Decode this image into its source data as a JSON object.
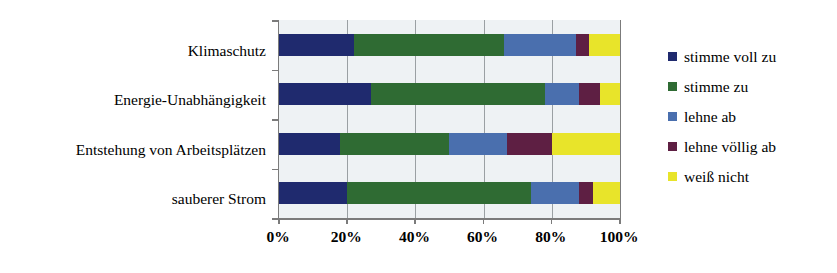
{
  "chart_data": {
    "type": "bar",
    "orientation": "horizontal",
    "stacked": true,
    "stack_mode": "percent",
    "title": "",
    "xlabel": "",
    "ylabel": "",
    "xlim": [
      0,
      100
    ],
    "grid": true,
    "legend_position": "right",
    "categories": [
      "Klimaschutz",
      "Energie-Unabhängigkeit",
      "Entstehung von Arbeitsplätzen",
      "sauberer Strom"
    ],
    "xticks": [
      "0%",
      "20%",
      "40%",
      "60%",
      "80%",
      "100%"
    ],
    "xtick_values": [
      0,
      20,
      40,
      60,
      80,
      100
    ],
    "series": [
      {
        "name": "stimme voll zu",
        "color": "#1f2a6e",
        "values": [
          22,
          27,
          18,
          20
        ]
      },
      {
        "name": "stimme zu",
        "color": "#2f6b33",
        "values": [
          44,
          51,
          32,
          54
        ]
      },
      {
        "name": "lehne ab",
        "color": "#4a6fae",
        "values": [
          21,
          10,
          17,
          14
        ]
      },
      {
        "name": "lehne völlig ab",
        "color": "#5e1f43",
        "values": [
          4,
          6,
          13,
          4
        ]
      },
      {
        "name": "weiß nicht",
        "color": "#e8e42a",
        "values": [
          9,
          6,
          20,
          8
        ]
      }
    ]
  },
  "legend": {
    "items": [
      {
        "label": "stimme voll zu",
        "color": "#1f2a6e",
        "swatch_name": "legend-swatch-stimme-voll-zu"
      },
      {
        "label": "stimme zu",
        "color": "#2f6b33",
        "swatch_name": "legend-swatch-stimme-zu"
      },
      {
        "label": "lehne ab",
        "color": "#4a6fae",
        "swatch_name": "legend-swatch-lehne-ab"
      },
      {
        "label": "lehne völlig ab",
        "color": "#5e1f43",
        "swatch_name": "legend-swatch-lehne-voellig-ab"
      },
      {
        "label": "weiß nicht",
        "color": "#e8e42a",
        "swatch_name": "legend-swatch-weiss-nicht"
      }
    ]
  },
  "colors": {
    "plot_background": "#eef2f4",
    "gridline": "#9aa0a3",
    "axis": "#7b7b7b",
    "text": "#000000",
    "page_background": "#ffffff"
  }
}
